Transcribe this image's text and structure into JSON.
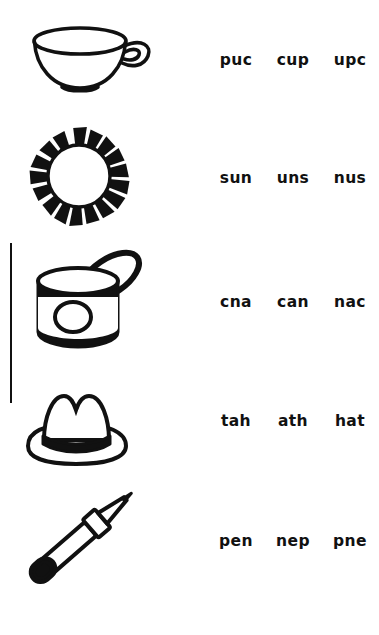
{
  "worksheet": {
    "title": "Word scramble picture matching worksheet",
    "ink_color": "#111111",
    "background_color": "#ffffff",
    "rows": [
      {
        "id": "cup",
        "picture": "teacup-illustration",
        "picture_label": "cup",
        "options": [
          "puc",
          "cup",
          "upc"
        ],
        "correct": "cup"
      },
      {
        "id": "sun",
        "picture": "sun-illustration",
        "picture_label": "sun",
        "options": [
          "sun",
          "uns",
          "nus"
        ],
        "correct": "sun"
      },
      {
        "id": "can",
        "picture": "can-illustration",
        "picture_label": "can",
        "options": [
          "cna",
          "can",
          "nac"
        ],
        "correct": "can"
      },
      {
        "id": "hat",
        "picture": "hat-illustration",
        "picture_label": "hat",
        "options": [
          "tah",
          "ath",
          "hat"
        ],
        "correct": "hat"
      },
      {
        "id": "pen",
        "picture": "pen-illustration",
        "picture_label": "pen",
        "options": [
          "pen",
          "nep",
          "pne"
        ],
        "correct": "pen"
      }
    ]
  }
}
